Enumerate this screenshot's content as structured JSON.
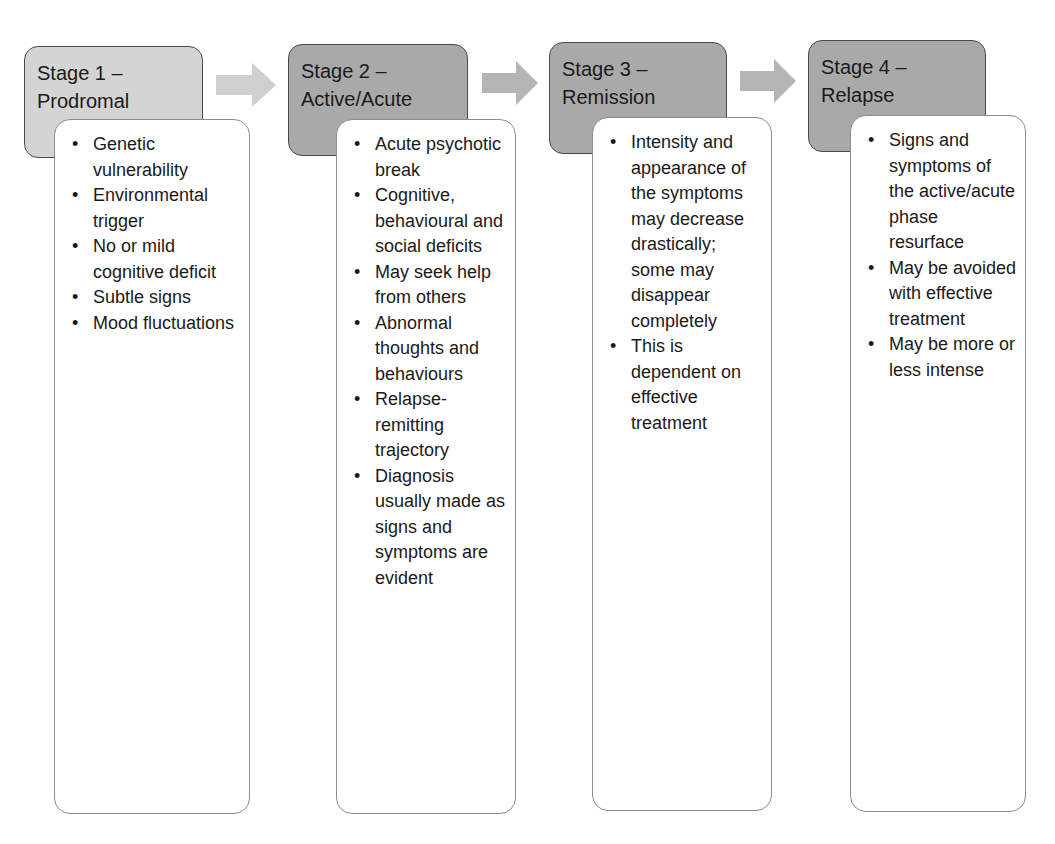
{
  "diagram": {
    "type": "stage-flow",
    "stages": [
      {
        "title_line1": "Stage 1 –",
        "title_line2": "Prodromal",
        "bullets": [
          "Genetic vulnerability",
          "Environmental trigger",
          "No or mild cognitive deficit",
          "Subtle signs",
          "Mood fluctuations"
        ]
      },
      {
        "title_line1": "Stage 2 –",
        "title_line2": "Active/Acute",
        "bullets": [
          "Acute psychotic break",
          "Cognitive, behavioural and social deficits",
          "May seek help from others",
          "Abnormal thoughts and behaviours",
          "Relapse-remitting trajectory",
          "Diagnosis usually made as signs and symptoms are evident"
        ]
      },
      {
        "title_line1": "Stage 3 –",
        "title_line2": "Remission",
        "bullets": [
          "Intensity and appearance of the symptoms may decrease drastically; some may disappear completely",
          "This is dependent on effective treatment"
        ]
      },
      {
        "title_line1": "Stage 4 –",
        "title_line2": "Relapse",
        "bullets": [
          "Signs and symptoms of the active/acute phase resurface",
          "May be avoided with effective treatment",
          "May be more or less intense"
        ]
      }
    ],
    "arrows": [
      {
        "from": "stage-1",
        "to": "stage-2",
        "color": "#cfcfcf"
      },
      {
        "from": "stage-2",
        "to": "stage-3",
        "color": "#b5b5b5"
      },
      {
        "from": "stage-3",
        "to": "stage-4",
        "color": "#b5b5b5"
      }
    ],
    "colors": {
      "stage1_header": "#d4d4d4",
      "stage_header": "#a9a9a9",
      "body_bg": "#ffffff",
      "border": "#4a4a4a"
    }
  }
}
